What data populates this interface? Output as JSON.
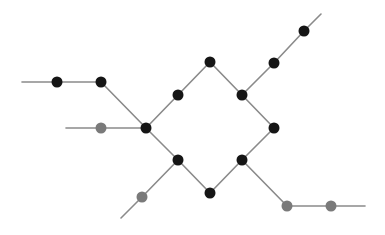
{
  "diagram": {
    "type": "graph",
    "colors": {
      "background": "#ffffff",
      "edge": "#8a8a8a",
      "node_dark": "#151515",
      "node_gray": "#7a7a7a"
    },
    "node_radius": 5.5,
    "nodes": [
      {
        "id": "n1",
        "x": 57,
        "y": 82,
        "tone": "dark"
      },
      {
        "id": "n2",
        "x": 101,
        "y": 82,
        "tone": "dark"
      },
      {
        "id": "g1",
        "x": 101,
        "y": 128,
        "tone": "gray"
      },
      {
        "id": "c_left",
        "x": 146,
        "y": 128,
        "tone": "dark"
      },
      {
        "id": "c_ul",
        "x": 178,
        "y": 95,
        "tone": "dark"
      },
      {
        "id": "c_top",
        "x": 210,
        "y": 62,
        "tone": "dark"
      },
      {
        "id": "c_ur",
        "x": 242,
        "y": 95,
        "tone": "dark"
      },
      {
        "id": "c_right",
        "x": 274,
        "y": 128,
        "tone": "dark"
      },
      {
        "id": "c_lr",
        "x": 242,
        "y": 160,
        "tone": "dark"
      },
      {
        "id": "c_bottom",
        "x": 210,
        "y": 193,
        "tone": "dark"
      },
      {
        "id": "c_ll",
        "x": 178,
        "y": 160,
        "tone": "dark"
      },
      {
        "id": "u1",
        "x": 274,
        "y": 63,
        "tone": "dark"
      },
      {
        "id": "u2",
        "x": 304,
        "y": 31,
        "tone": "dark"
      },
      {
        "id": "g2",
        "x": 142,
        "y": 197,
        "tone": "gray"
      },
      {
        "id": "g3",
        "x": 287,
        "y": 206,
        "tone": "gray"
      },
      {
        "id": "g4",
        "x": 331,
        "y": 206,
        "tone": "gray"
      }
    ],
    "edges": [
      [
        22,
        82,
        57,
        82
      ],
      [
        57,
        82,
        101,
        82
      ],
      [
        101,
        82,
        146,
        128
      ],
      [
        66,
        128,
        101,
        128
      ],
      [
        101,
        128,
        146,
        128
      ],
      [
        146,
        128,
        178,
        95
      ],
      [
        178,
        95,
        210,
        62
      ],
      [
        210,
        62,
        242,
        95
      ],
      [
        242,
        95,
        274,
        128
      ],
      [
        274,
        128,
        242,
        160
      ],
      [
        242,
        160,
        210,
        193
      ],
      [
        210,
        193,
        178,
        160
      ],
      [
        178,
        160,
        146,
        128
      ],
      [
        242,
        95,
        274,
        63
      ],
      [
        274,
        63,
        304,
        31
      ],
      [
        304,
        31,
        321,
        14
      ],
      [
        178,
        160,
        142,
        197
      ],
      [
        142,
        197,
        121,
        218
      ],
      [
        242,
        160,
        287,
        206
      ],
      [
        287,
        206,
        331,
        206
      ],
      [
        331,
        206,
        365,
        206
      ]
    ]
  }
}
